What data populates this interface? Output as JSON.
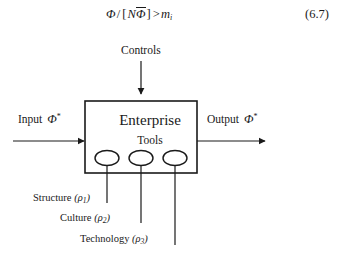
{
  "figure": {
    "equation": {
      "lhs_numerator": "Φ",
      "divider": "/",
      "bracket_open": "[",
      "inside_first": "N",
      "inside_overbar": "Φ",
      "bracket_close": "]",
      "relation": ">",
      "rhs_symbol": "m",
      "rhs_subscript": "i",
      "number": "(6.7)"
    },
    "controls": {
      "label": "Controls"
    },
    "box": {
      "title": "Enterprise",
      "subtitle": "Tools"
    },
    "input": {
      "label": "Input",
      "symbol": "Φ",
      "mark": "*"
    },
    "output": {
      "label": "Output",
      "symbol": "Φ",
      "mark": "*"
    },
    "mechanisms": [
      {
        "label": "Structure",
        "symbol": "ρ",
        "index": "1",
        "open": "(",
        "close": ")"
      },
      {
        "label": "Culture",
        "symbol": "ρ",
        "index": "2",
        "open": "(",
        "close": ")"
      },
      {
        "label": "Technology",
        "symbol": "ρ",
        "index": "3",
        "open": "(",
        "close": ")"
      }
    ],
    "colors": {
      "ink": "#1a1a1a",
      "paper": "#ffffff"
    }
  }
}
